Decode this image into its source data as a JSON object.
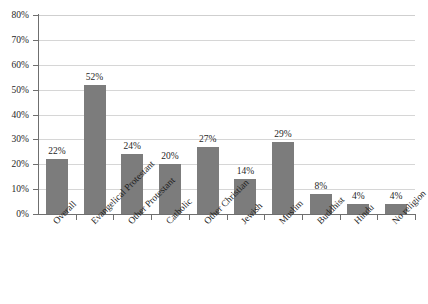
{
  "chart_data": {
    "type": "bar",
    "title": "",
    "subtitle": "",
    "xlabel": "",
    "ylabel": "",
    "ylim": [
      0,
      80
    ],
    "y_tick_step": 10,
    "grid": "horizontal",
    "legend": "none",
    "value_label_suffix": "%",
    "categories": [
      "Overall",
      "Evangelical Protestant",
      "Other Protestant",
      "Catholic",
      "Other Christian",
      "Jewish",
      "Muslim",
      "Buddhist",
      "Hindu",
      "No religion"
    ],
    "values": [
      22,
      52,
      24,
      20,
      27,
      14,
      29,
      8,
      4,
      4
    ],
    "value_labels": [
      "22%",
      "52%",
      "24%",
      "20%",
      "27%",
      "14%",
      "29%",
      "8%",
      "4%",
      "4%"
    ],
    "y_tick_labels": [
      "0%",
      "10%",
      "20%",
      "30%",
      "40%",
      "50%",
      "60%",
      "70%",
      "80%"
    ],
    "y_tick_values": [
      0,
      10,
      20,
      30,
      40,
      50,
      60,
      70,
      80
    ],
    "colors": {
      "bar": "#7c7c7c",
      "gridline": "#d6d6d6",
      "axis": "#6f6f6f",
      "text": "#1f1f1f",
      "background": "#ffffff"
    }
  }
}
